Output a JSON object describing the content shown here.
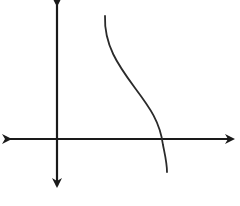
{
  "diagram": {
    "type": "function-graph-sketch",
    "colors": {
      "background": "#ffffff",
      "axes": "#1a1a1a",
      "curve": "#2a2a2a"
    },
    "axes": {
      "x_axis": {
        "y": 139,
        "x_start": 10,
        "x_end": 233,
        "arrows": "both"
      },
      "y_axis": {
        "x": 57,
        "y_start": 5,
        "y_end": 186,
        "arrows": "both"
      }
    },
    "curve": {
      "shape": "decreasing, concave-up then concave-down, crosses x-axis once",
      "start": [
        105,
        16
      ],
      "end": [
        167,
        172
      ],
      "x_intercept": [
        162,
        139
      ],
      "path": "M105,16 C104,45 118,65 135,88 C150,108 160,122 163,145 C165,155 167,163 167,172"
    }
  }
}
